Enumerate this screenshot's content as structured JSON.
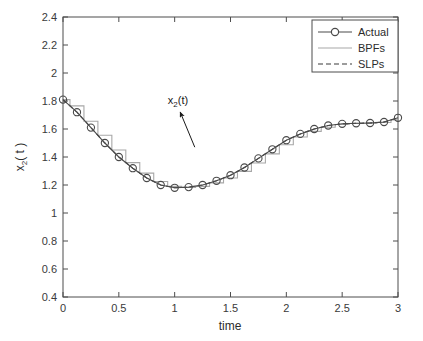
{
  "chart_data": {
    "type": "line",
    "title": "",
    "subtitle": "",
    "xlabel": "time",
    "ylabel": "x_2( t )",
    "ylabel_base": "x",
    "ylabel_sub": "2",
    "ylabel_tail": "( t )",
    "xlim": [
      0,
      3
    ],
    "ylim": [
      0.4,
      2.4
    ],
    "xticks": [
      0,
      0.5,
      1,
      1.5,
      2,
      2.5,
      3
    ],
    "xticklabels": [
      "0",
      "0.5",
      "1",
      "1.5",
      "2",
      "2.5",
      "3"
    ],
    "yticks": [
      0.4,
      0.6,
      0.8,
      1,
      1.2,
      1.4,
      1.6,
      1.8,
      2,
      2.2,
      2.4
    ],
    "yticklabels": [
      "0.4",
      "0.6",
      "0.8",
      "1",
      "1.2",
      "1.4",
      "1.6",
      "1.8",
      "2",
      "2.2",
      "2.4"
    ],
    "grid": false,
    "legend_position": "top-right",
    "legend_entries": [
      "Actual",
      "BPFs",
      "SLPs"
    ],
    "x": [
      0,
      0.125,
      0.25,
      0.375,
      0.5,
      0.625,
      0.75,
      0.875,
      1.0,
      1.125,
      1.25,
      1.375,
      1.5,
      1.625,
      1.75,
      1.875,
      2.0,
      2.125,
      2.25,
      2.375,
      2.5,
      2.625,
      2.75,
      2.875,
      3.0
    ],
    "series": [
      {
        "name": "Actual",
        "style": "solid-with-circle-markers",
        "color": "#4a4a4a",
        "marker": "circle",
        "values": [
          1.81,
          1.72,
          1.61,
          1.5,
          1.4,
          1.32,
          1.25,
          1.2,
          1.18,
          1.185,
          1.2,
          1.23,
          1.27,
          1.325,
          1.39,
          1.455,
          1.52,
          1.565,
          1.6,
          1.625,
          1.637,
          1.641,
          1.643,
          1.65,
          1.68
        ]
      },
      {
        "name": "BPFs",
        "style": "solid-staircase",
        "color": "#a8a8a8",
        "marker": "none",
        "values": [
          1.81,
          1.765,
          1.655,
          1.555,
          1.45,
          1.36,
          1.285,
          1.225,
          1.19,
          1.182,
          1.19,
          1.215,
          1.25,
          1.297,
          1.357,
          1.422,
          1.487,
          1.543,
          1.583,
          1.613,
          1.632,
          1.639,
          1.642,
          1.646,
          1.665
        ]
      },
      {
        "name": "SLPs",
        "style": "dashed",
        "color": "#3a3a3a",
        "marker": "none",
        "values": [
          1.81,
          1.72,
          1.61,
          1.5,
          1.4,
          1.32,
          1.25,
          1.2,
          1.18,
          1.185,
          1.2,
          1.23,
          1.27,
          1.325,
          1.39,
          1.455,
          1.52,
          1.565,
          1.6,
          1.625,
          1.637,
          1.641,
          1.643,
          1.65,
          1.68
        ]
      }
    ],
    "annotations": [
      {
        "text": "x_2(t)",
        "text_base": "x",
        "text_sub": "2",
        "text_tail": "(t)",
        "x": 1.03,
        "y": 1.78,
        "arrow_from_x": 1.18,
        "arrow_from_y": 1.47,
        "arrow_to_x": 1.05,
        "arrow_to_y": 1.72
      }
    ],
    "colors": {
      "axis": "#4d4d4d",
      "actual": "#4a4a4a",
      "bpfs": "#a8a8a8",
      "slps": "#3a3a3a",
      "background": "#ffffff"
    }
  }
}
